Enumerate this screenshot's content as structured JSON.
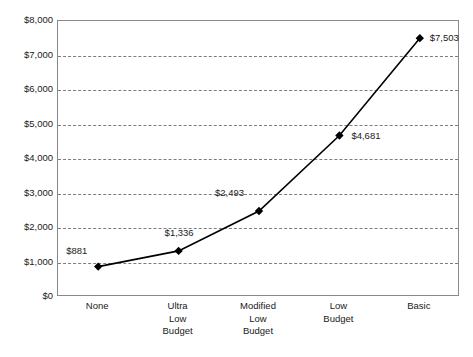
{
  "chart_data": {
    "type": "line",
    "title": "",
    "subtitle": "",
    "xlabel": "",
    "ylabel": "",
    "categories": [
      "None",
      "Ultra Low Budget",
      "Modified Low Budget",
      "Low Budget",
      "Basic"
    ],
    "category_lines": [
      [
        "None"
      ],
      [
        "Ultra",
        "Low",
        "Budget"
      ],
      [
        "Modified",
        "Low",
        "Budget"
      ],
      [
        "Low",
        "Budget"
      ],
      [
        "Basic"
      ]
    ],
    "values": [
      881,
      1336,
      2493,
      4681,
      7503
    ],
    "point_labels": [
      "$881",
      "$1,336",
      "$2,493",
      "$4,681",
      "$7,503"
    ],
    "ylim": [
      0,
      8000
    ],
    "ytick_values": [
      0,
      1000,
      2000,
      3000,
      4000,
      5000,
      6000,
      7000,
      8000
    ],
    "ytick_labels": [
      "$0",
      "$1,000",
      "$2,000",
      "$3,000",
      "$4,000",
      "$5,000",
      "$6,000",
      "$7,000",
      "$8,000"
    ],
    "grid": true,
    "grid_axis": "y",
    "grid_style": "dashed",
    "legend": false,
    "legend_position": "none",
    "marker": "diamond",
    "series_color": "#000000",
    "grid_color": "#7d7d7d",
    "axis_color": "#8a8a8a",
    "background_color": "#ffffff",
    "text_color": "#1a1a1a",
    "label_offsets": [
      {
        "dx": -32,
        "dy": -22
      },
      {
        "dx": -14,
        "dy": -24
      },
      {
        "dx": -44,
        "dy": -24
      },
      {
        "dx": 12,
        "dy": -6
      },
      {
        "dx": 10,
        "dy": -6
      }
    ]
  }
}
